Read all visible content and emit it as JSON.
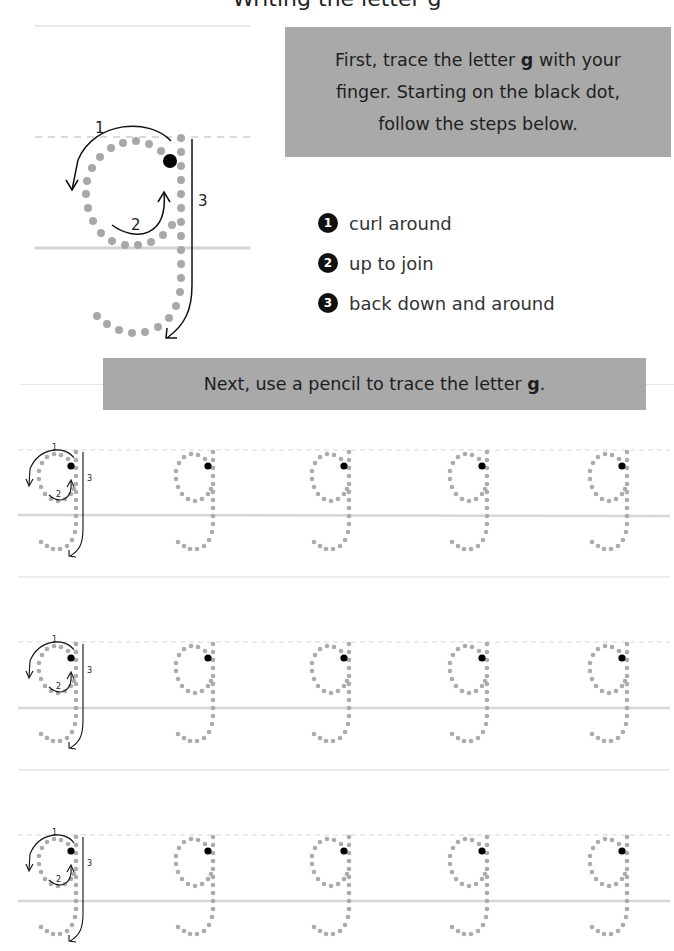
{
  "header": {
    "title_partial": "Writing the letter g"
  },
  "instruction_box": {
    "line1_pre": "First, trace the letter ",
    "letter": "g",
    "line1_post": " with your",
    "line2": "finger. Starting on the black dot,",
    "line3": "follow the steps below."
  },
  "model_letter": {
    "letter": "g",
    "arrow_labels": [
      "1",
      "2",
      "3"
    ],
    "start_dot": "black-dot"
  },
  "steps": [
    {
      "number": "1",
      "text": "curl around"
    },
    {
      "number": "2",
      "text": "up to join"
    },
    {
      "number": "3",
      "text": "back down and around"
    }
  ],
  "practice_box": {
    "text_pre": "Next, use a pencil to trace the letter ",
    "letter": "g",
    "text_post": "."
  },
  "practice_rows": [
    {
      "row": 1,
      "guided_letter_labels": [
        "1",
        "2",
        "3"
      ],
      "trace_letters": 4
    },
    {
      "row": 2,
      "guided_letter_labels": [
        "1",
        "2",
        "3"
      ],
      "trace_letters": 4
    },
    {
      "row": 3,
      "guided_letter_labels": [
        "1",
        "2",
        "3"
      ],
      "trace_letters": 4
    }
  ],
  "colors": {
    "box_gray": "#a9a9a9",
    "dot_gray": "#a8a8a8",
    "guide_line": "#d9d9d9",
    "start_dot": "#000000"
  }
}
